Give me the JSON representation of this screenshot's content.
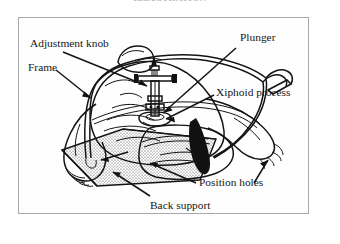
{
  "figure": {
    "top_caption": "ILLUSTRATION",
    "kind": "line-drawing",
    "frame": {
      "border_color": "#a8a8ac",
      "background_color": "#fefefe",
      "ink_color": "#141414"
    }
  },
  "labels": [
    {
      "id": "adjustment-knob",
      "text": "Adjustment knob"
    },
    {
      "id": "frame",
      "text": "Frame"
    },
    {
      "id": "plunger",
      "text": "Plunger"
    },
    {
      "id": "xiphoid-process",
      "text": "Xiphoid process"
    },
    {
      "id": "position-holes",
      "text": "Position holes"
    },
    {
      "id": "back-support",
      "text": "Back support"
    }
  ],
  "parts": {
    "arch_frame": "arch-frame",
    "plunger_shaft": "plunger-shaft",
    "plunger_pad": "plunger-pad",
    "adjustment_knob": "adjustment-knob-part",
    "back_support_board": "back-support-board",
    "position_holes": "position-holes-part",
    "patient_torso": "patient-torso",
    "patient_arm_left": "patient-arm-left",
    "patient_arm_right": "patient-arm-right",
    "handle_grip": "handle-grip"
  }
}
